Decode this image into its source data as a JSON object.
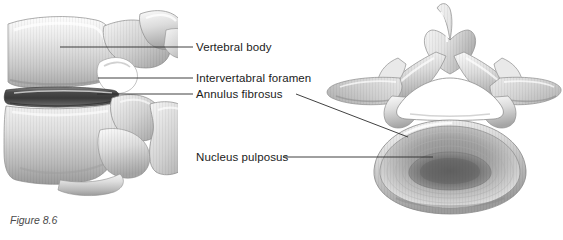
{
  "figure": {
    "caption": "Figure 8.6",
    "background_color": "#ffffff",
    "leader_line_color": "#2b2b2b",
    "label_text_color": "#1b1b1b"
  },
  "labels": {
    "vertebral_body": "Vertebral body",
    "intervertebral_foramen": "Intervertabral foramen",
    "annulus_fibrosus": "Annulus fibrosus",
    "nucleus_pulposus": "Nucleus pulposus"
  },
  "illustrations": [
    {
      "name": "lateral-view-vertebrae",
      "view": "lateral",
      "structures": [
        "superior vertebral body",
        "inferior vertebral body",
        "intervertebral disc",
        "intervertebral foramen",
        "pedicle",
        "superior articular process",
        "inferior articular process",
        "spinous process"
      ]
    },
    {
      "name": "superior-view-vertebra",
      "view": "superior",
      "structures": [
        "vertebral body",
        "annulus fibrosus",
        "nucleus pulposus",
        "vertebral foramen",
        "pedicle",
        "lamina",
        "transverse process left",
        "transverse process right",
        "bifid spinous process",
        "superior articular facet"
      ]
    }
  ],
  "leader_lines": [
    {
      "name": "vertebral-body-leader",
      "from": [
        193,
        47
      ],
      "to": [
        60,
        47
      ]
    },
    {
      "name": "intervertebral-foramen-leader",
      "from": [
        193,
        78
      ],
      "to": [
        98,
        78
      ]
    },
    {
      "name": "annulus-fibrosus-leader-left",
      "from": [
        193,
        94
      ],
      "to": [
        97,
        94
      ]
    },
    {
      "name": "annulus-fibrosus-leader-right",
      "from": [
        296,
        94
      ],
      "to": [
        406,
        136
      ]
    },
    {
      "name": "nucleus-pulposus-leader",
      "from": [
        283,
        157
      ],
      "to": [
        432,
        157
      ]
    }
  ]
}
